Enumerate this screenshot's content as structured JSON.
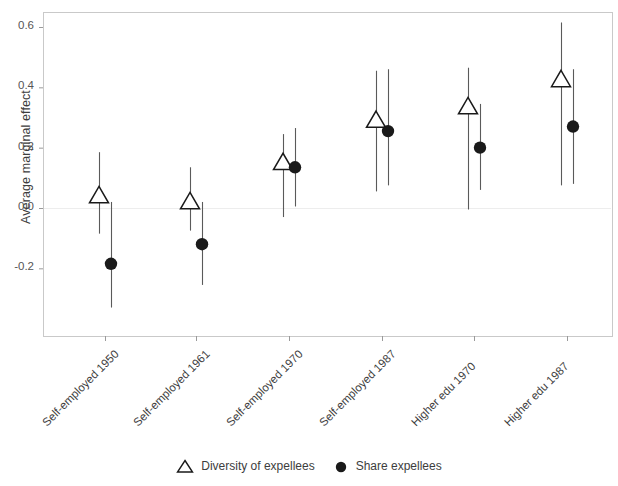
{
  "chart_data": {
    "type": "scatter",
    "title": "",
    "xlabel": "",
    "ylabel": "Average marginal effect",
    "ylim": [
      -0.33,
      0.66
    ],
    "yticks": [
      0.6,
      0.4,
      0.2,
      0.0,
      -0.2
    ],
    "ytick_labels": [
      "0.6",
      "0.4",
      "0.2",
      "0.0",
      "-0.2"
    ],
    "categories": [
      "Self-employed 1950",
      "Self-employed 1961",
      "Self-employed 1970",
      "Self-employed 1987",
      "Higher edu 1970",
      "Higher edu 1987"
    ],
    "grid": false,
    "zero_line": true,
    "legend_position": "bottom",
    "series": [
      {
        "name": "Diversity of expellees",
        "marker": "triangle-open",
        "color": "#1a1a1a",
        "values": [
          0.04,
          0.02,
          0.15,
          0.29,
          0.335,
          0.425
        ],
        "ci_low": [
          -0.085,
          -0.075,
          -0.03,
          0.055,
          -0.005,
          0.075
        ],
        "ci_high": [
          0.185,
          0.135,
          0.245,
          0.455,
          0.465,
          0.615
        ]
      },
      {
        "name": "Share expellees",
        "marker": "circle-filled",
        "color": "#1a1a1a",
        "values": [
          -0.185,
          -0.12,
          0.135,
          0.255,
          0.2,
          0.27
        ],
        "ci_low": [
          -0.33,
          -0.255,
          0.005,
          0.075,
          0.06,
          0.08
        ],
        "ci_high": [
          0.02,
          0.02,
          0.265,
          0.46,
          0.345,
          0.46
        ]
      }
    ]
  },
  "legend": {
    "entries": [
      {
        "label": "Diversity of expellees",
        "marker": "triangle-open"
      },
      {
        "label": "Share expellees",
        "marker": "circle-filled"
      }
    ]
  },
  "axis": {
    "y_title": "Average marginal effect"
  }
}
